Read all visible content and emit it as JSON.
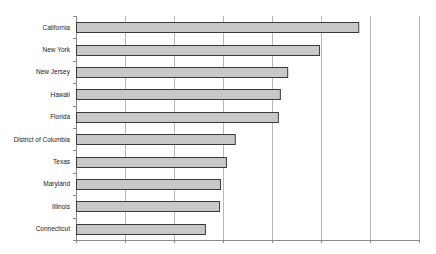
{
  "chart_data": {
    "type": "bar",
    "orientation": "horizontal",
    "title": "",
    "xlabel": "",
    "ylabel": "",
    "categories": [
      "California",
      "New York",
      "New Jersey",
      "Hawaii",
      "Florida",
      "District of Columbia",
      "Texas",
      "Maryland",
      "Illinois",
      "Connecticut"
    ],
    "values": [
      5.76,
      4.96,
      4.31,
      4.16,
      4.12,
      3.24,
      3.06,
      2.94,
      2.92,
      2.63
    ],
    "value_units": "gridline intervals (no x-axis tick labels shown)",
    "xlim": [
      0,
      7
    ],
    "x_gridlines": [
      0,
      1,
      2,
      3,
      4,
      5,
      6,
      7
    ],
    "grid": true,
    "legend": null,
    "x_tick_labels_visible": false
  },
  "colors": {
    "bar_fill": "#c8c8c8",
    "bar_border": "#3a3a3a",
    "grid": "#b8b8b8",
    "axis": "#8a8a8a",
    "label": "#222222"
  }
}
